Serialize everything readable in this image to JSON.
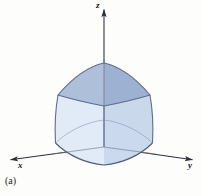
{
  "figure": {
    "caption": "(a)",
    "background_color": "#fdfdfc",
    "axes": {
      "origin": {
        "x": 104,
        "y": 147
      },
      "axis_color": "#2b2f38",
      "labels": {
        "z": "z",
        "x": "x",
        "y": "y"
      },
      "z_axis": {
        "from": [
          104,
          147
        ],
        "to": [
          104,
          10
        ],
        "arrow": "up",
        "label_pos": [
          96,
          1
        ]
      },
      "x_axis": {
        "from": [
          104,
          147
        ],
        "to": [
          9,
          160
        ],
        "arrow": "down-left",
        "label_pos": [
          18,
          161
        ]
      },
      "y_axis": {
        "from": [
          104,
          147
        ],
        "to": [
          194,
          160
        ],
        "arrow": "down-right",
        "label_pos": [
          188,
          161
        ]
      }
    },
    "solid": {
      "description": "truncated solid with rounded square cross-section, wider at base, narrower at top",
      "edge_color": "#5c6d8c",
      "top_face_color": "#a9bbd8",
      "left_face_color": "#e3ebf7",
      "right_face_color": "#cbd9ee",
      "front_left_face_color": "#dbe5f4",
      "front_right_face_color": "#c3d3ea",
      "top_center": [
        104,
        106
      ],
      "bottom_center": [
        104,
        147
      ],
      "top_back": [
        104,
        63
      ],
      "top_left": [
        58,
        95
      ],
      "top_right": [
        150,
        95
      ],
      "bottom_back": [
        104,
        120
      ],
      "bottom_left": [
        46,
        151
      ],
      "bottom_right": [
        162,
        151
      ],
      "bottom_front": [
        104,
        164
      ]
    }
  }
}
